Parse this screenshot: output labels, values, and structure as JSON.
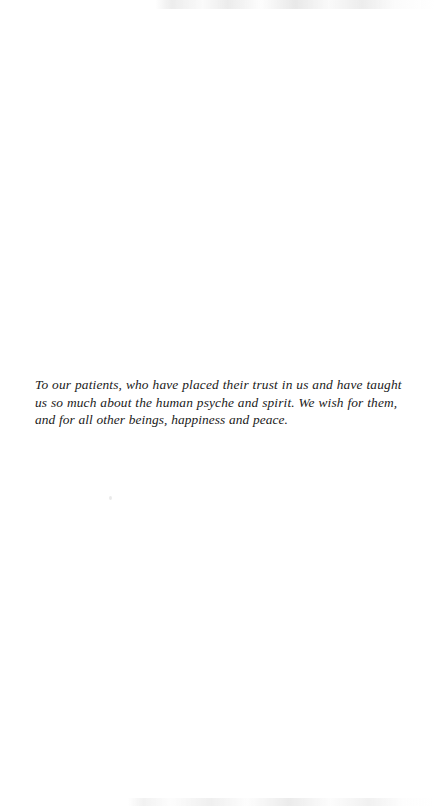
{
  "page": {
    "type": "book-dedication-page",
    "background_color": "#ffffff",
    "ink_color": "#1a1a1a"
  },
  "dedication": {
    "full_text": "To our patients, who have placed their trust in us and have taught us so much about the human psyche and spirit. We wish for them, and for all other beings, happiness and peace.",
    "lines": [
      "To our patients, who have placed their trust in us and have taught",
      "us so much about the human psyche and spirit. We wish for them,",
      "and for all other beings, happiness and peace."
    ]
  }
}
